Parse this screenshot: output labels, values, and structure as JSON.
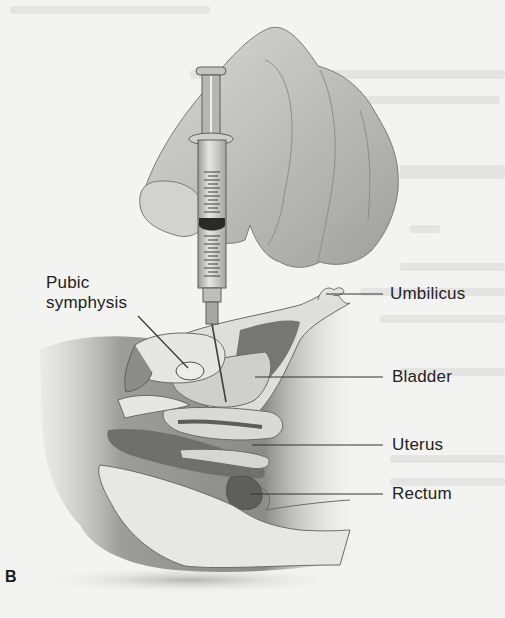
{
  "figure": {
    "panel_label": "B",
    "labels": [
      {
        "id": "pubic-symphysis",
        "text_line1": "Pubic",
        "text_line2": "symphysis"
      },
      {
        "id": "umbilicus",
        "text": "Umbilicus"
      },
      {
        "id": "bladder",
        "text": "Bladder"
      },
      {
        "id": "uterus",
        "text": "Uterus"
      },
      {
        "id": "rectum",
        "text": "Rectum"
      }
    ]
  },
  "colors": {
    "background": "#f3f3f1",
    "label_text": "#222222",
    "leader_line": "#333333",
    "skin_light": "#d6d6d4",
    "skin_mid": "#a9a9a7",
    "tissue_dark": "#6e6e6c",
    "organ_light": "#e4e4e2"
  }
}
